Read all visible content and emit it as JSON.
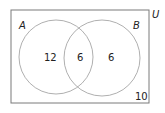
{
  "diagram": {
    "type": "venn",
    "universe_label": "U",
    "sets": [
      {
        "label": "A",
        "only": "12"
      },
      {
        "label": "B",
        "only": "6"
      }
    ],
    "intersection": "6",
    "outside": "10"
  },
  "colors": {
    "border": "#7a7a7a",
    "circle": "#9a9a9a",
    "text": "#222222"
  }
}
